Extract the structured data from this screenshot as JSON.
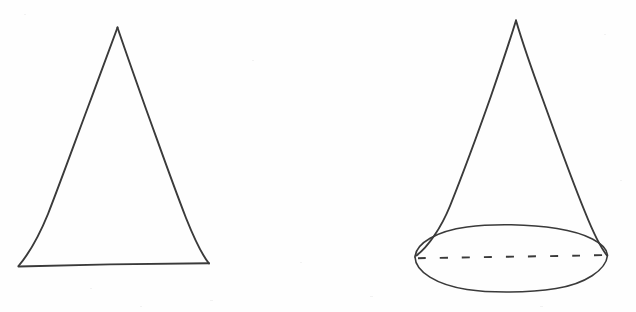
{
  "canvas": {
    "width": 636,
    "height": 312,
    "background_color": "#fefefe",
    "ink_color": "#3a3a3a",
    "description": "Hand-drawn pencil sketch on white paper showing two geometry figures side by side: a plane triangle on the left and a three-dimensional cone on the right.",
    "figure_count": "2"
  },
  "figures": [
    {
      "id": "triangle",
      "name": "Triangle",
      "kind": "2d-polygon",
      "label": "",
      "stroke_style": "solid",
      "vertices": [
        {
          "name": "apex",
          "x": 117,
          "y": 27
        },
        {
          "name": "base-right",
          "x": 209,
          "y": 263
        },
        {
          "name": "base-left",
          "x": 18,
          "y": 266
        }
      ],
      "path": "M117,27 L209,263 L18,266 Z"
    },
    {
      "id": "cone",
      "name": "Cone",
      "kind": "3d-solid",
      "label": "",
      "stroke_style": "solid outline with dashed hidden diameter",
      "apex": {
        "x": 516,
        "y": 20
      },
      "base_ellipse": {
        "center_x": 511,
        "center_y": 259,
        "radius_x": 96,
        "radius_y": 32,
        "left_point_x": 415,
        "left_point_y": 257,
        "right_point_x": 607,
        "right_point_y": 255
      },
      "hidden_diameter": {
        "style": "dashed",
        "dash_length": 8,
        "gap_length": 14,
        "x1": 418,
        "y1": 258,
        "x2": 605,
        "y2": 255
      },
      "slant_left_path": "M516,20 L416,255",
      "slant_right_path": "M516,20 L607,255"
    }
  ]
}
